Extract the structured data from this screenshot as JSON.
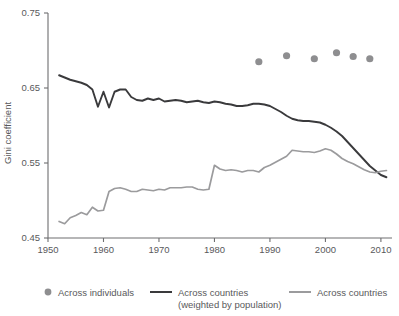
{
  "chart_data": {
    "type": "line",
    "title": "",
    "subtitle": "",
    "xlabel": "",
    "ylabel": "Gini coefficient",
    "xlim": [
      1950,
      2012
    ],
    "ylim": [
      0.45,
      0.75
    ],
    "x_ticks": [
      1950,
      1960,
      1970,
      1980,
      1990,
      2000,
      2010
    ],
    "y_ticks": [
      0.45,
      0.55,
      0.65,
      0.75
    ],
    "grid": false,
    "legend_position": "bottom",
    "series": [
      {
        "name": "Across individuals",
        "type": "scatter",
        "color": "#8e8e90",
        "x": [
          1988,
          1993,
          1998,
          2002,
          2005,
          2008
        ],
        "values": [
          0.685,
          0.693,
          0.689,
          0.697,
          0.692,
          0.689
        ]
      },
      {
        "name": "Across countries (weighted by population)",
        "type": "line",
        "color": "#3a3a3c",
        "x": [
          1952,
          1953,
          1954,
          1955,
          1956,
          1957,
          1958,
          1959,
          1960,
          1961,
          1962,
          1963,
          1964,
          1965,
          1966,
          1967,
          1968,
          1969,
          1970,
          1971,
          1972,
          1973,
          1974,
          1975,
          1976,
          1977,
          1978,
          1979,
          1980,
          1981,
          1982,
          1983,
          1984,
          1985,
          1986,
          1987,
          1988,
          1989,
          1990,
          1991,
          1992,
          1993,
          1994,
          1995,
          1996,
          1997,
          1998,
          1999,
          2000,
          2001,
          2002,
          2003,
          2004,
          2005,
          2006,
          2007,
          2008,
          2009,
          2010,
          2011
        ],
        "values": [
          0.667,
          0.664,
          0.661,
          0.659,
          0.657,
          0.654,
          0.648,
          0.625,
          0.645,
          0.624,
          0.645,
          0.648,
          0.648,
          0.638,
          0.634,
          0.633,
          0.636,
          0.634,
          0.636,
          0.632,
          0.633,
          0.634,
          0.633,
          0.631,
          0.632,
          0.633,
          0.631,
          0.63,
          0.632,
          0.631,
          0.629,
          0.628,
          0.626,
          0.626,
          0.627,
          0.629,
          0.629,
          0.628,
          0.626,
          0.622,
          0.618,
          0.613,
          0.609,
          0.607,
          0.606,
          0.606,
          0.605,
          0.604,
          0.601,
          0.597,
          0.592,
          0.586,
          0.578,
          0.57,
          0.562,
          0.554,
          0.546,
          0.54,
          0.534,
          0.531
        ]
      },
      {
        "name": "Across countries",
        "type": "line",
        "color": "#9b9b9d",
        "x": [
          1952,
          1953,
          1954,
          1955,
          1956,
          1957,
          1958,
          1959,
          1960,
          1961,
          1962,
          1963,
          1964,
          1965,
          1966,
          1967,
          1968,
          1969,
          1970,
          1971,
          1972,
          1973,
          1974,
          1975,
          1976,
          1977,
          1978,
          1979,
          1980,
          1981,
          1982,
          1983,
          1984,
          1985,
          1986,
          1987,
          1988,
          1989,
          1990,
          1991,
          1992,
          1993,
          1994,
          1995,
          1996,
          1997,
          1998,
          1999,
          2000,
          2001,
          2002,
          2003,
          2004,
          2005,
          2006,
          2007,
          2008,
          2009,
          2010,
          2011
        ],
        "values": [
          0.472,
          0.469,
          0.477,
          0.48,
          0.484,
          0.481,
          0.491,
          0.486,
          0.487,
          0.512,
          0.516,
          0.517,
          0.515,
          0.512,
          0.512,
          0.515,
          0.514,
          0.513,
          0.515,
          0.514,
          0.517,
          0.517,
          0.517,
          0.518,
          0.518,
          0.515,
          0.514,
          0.515,
          0.547,
          0.542,
          0.54,
          0.541,
          0.54,
          0.538,
          0.54,
          0.54,
          0.538,
          0.544,
          0.547,
          0.551,
          0.555,
          0.559,
          0.567,
          0.566,
          0.565,
          0.565,
          0.564,
          0.566,
          0.569,
          0.567,
          0.562,
          0.556,
          0.552,
          0.549,
          0.545,
          0.541,
          0.538,
          0.537,
          0.539,
          0.54
        ]
      }
    ],
    "legend": [
      {
        "label": "Across individuals",
        "marker": "dot",
        "color": "#8e8e90"
      },
      {
        "label": "Across countries",
        "label2": "(weighted by population)",
        "marker": "line",
        "color": "#3a3a3c"
      },
      {
        "label": "Across countries",
        "marker": "line",
        "color": "#9b9b9d"
      }
    ]
  },
  "axis": {
    "y_title": "Gini coefficient",
    "y_tick_labels": [
      "0.75",
      "0.65",
      "0.55",
      "0.45"
    ],
    "x_tick_labels": [
      "1950",
      "1960",
      "1970",
      "1980",
      "1990",
      "2000",
      "2010"
    ]
  },
  "legend": {
    "individuals_label": "Across individuals",
    "weighted_label": "Across countries",
    "weighted_label_line2": "(weighted by population)",
    "countries_label": "Across countries"
  }
}
